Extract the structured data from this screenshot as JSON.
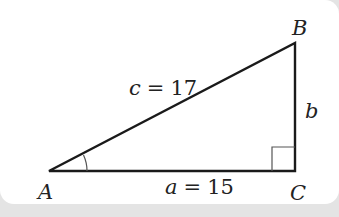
{
  "diagram": {
    "type": "right-triangle",
    "vertices": {
      "A": {
        "label": "A"
      },
      "B": {
        "label": "B"
      },
      "C": {
        "label": "C"
      }
    },
    "sides": {
      "hypotenuse": {
        "var": "c",
        "eq": "=",
        "value": "17"
      },
      "base": {
        "var": "a",
        "eq": "=",
        "value": "15"
      },
      "vertical": {
        "var": "b"
      }
    },
    "right_angle_at": "C",
    "marked_angle_at": "A",
    "colors": {
      "line": "#1a1a1a",
      "background": "#ffffff",
      "frame": "#e4e4e4"
    }
  }
}
